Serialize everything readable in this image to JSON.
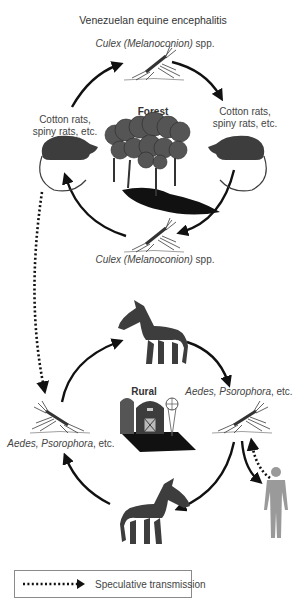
{
  "title": "Venezuelan equine encephalitis",
  "enzootic_cycle": {
    "habitat_label": "Forest",
    "vector_top": {
      "genus": "Culex (Melanoconion)",
      "suffix": " spp."
    },
    "vector_bottom": {
      "genus": "Culex (Melanoconion)",
      "suffix": " spp."
    },
    "host_left": {
      "line1": "Cotton rats,",
      "line2": "spiny rats, etc."
    },
    "host_right": {
      "line1": "Cotton rats,",
      "line2": "spiny rats, etc."
    }
  },
  "epizootic_cycle": {
    "habitat_label": "Rural",
    "vector_left": {
      "genus": "Aedes, Psorophora",
      "suffix": ", etc."
    },
    "vector_right": {
      "genus": "Aedes, Psorophora",
      "suffix": ", etc."
    },
    "host_top": "horse",
    "host_bottom": "horse",
    "dead_end_host": "human"
  },
  "legend": {
    "label": "Speculative transmission",
    "symbol": "dotted-arrow"
  },
  "colors": {
    "arrow": "#111111",
    "animal": "#3d3d3d",
    "human": "#9a9a9a",
    "text": "#444444",
    "legend_border": "#8a8a8a"
  }
}
